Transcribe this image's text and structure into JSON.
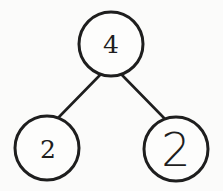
{
  "diagram": {
    "type": "number-bond",
    "whole": {
      "value": "4"
    },
    "parts": [
      {
        "value": "2"
      },
      {
        "value": "2"
      }
    ]
  },
  "colors": {
    "stroke": "#1e1e1e",
    "background": "#fbfbfa"
  }
}
